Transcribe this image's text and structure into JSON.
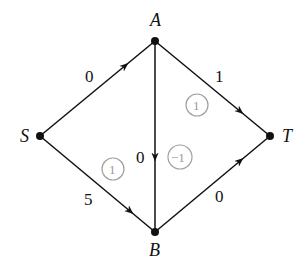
{
  "diagram": {
    "type": "directed-graph",
    "nodes": [
      {
        "id": "S",
        "label": "S",
        "x": 40,
        "y": 136
      },
      {
        "id": "A",
        "label": "A",
        "x": 155,
        "y": 41
      },
      {
        "id": "T",
        "label": "T",
        "x": 270,
        "y": 136
      },
      {
        "id": "B",
        "label": "B",
        "x": 155,
        "y": 232
      }
    ],
    "edges": [
      {
        "from": "S",
        "to": "A",
        "weight": "0"
      },
      {
        "from": "A",
        "to": "T",
        "weight": "1"
      },
      {
        "from": "A",
        "to": "B",
        "weight": "0"
      },
      {
        "from": "S",
        "to": "B",
        "weight": "5"
      },
      {
        "from": "B",
        "to": "T",
        "weight": "0"
      }
    ],
    "circled_values": [
      {
        "label": "1",
        "region": "A-T-B upper right"
      },
      {
        "label": "1",
        "region": "S-A-B left"
      },
      {
        "label": "−1",
        "region": "right of A-B edge"
      }
    ],
    "colors": {
      "line": "#111111",
      "circle": "#a0a0a0"
    }
  }
}
